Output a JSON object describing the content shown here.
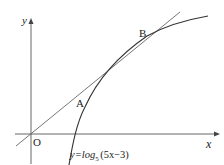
{
  "diagram": {
    "axes": {
      "x_label": "x",
      "y_label": "y",
      "origin_label": "O"
    },
    "points": [
      {
        "label": "A"
      },
      {
        "label": "B"
      }
    ],
    "curve": {
      "label_prefix": "y=log",
      "label_base": "5",
      "label_arg": "(5x−3)"
    },
    "colors": {
      "axis": "#444444",
      "curve": "#333333",
      "line": "#555555",
      "text": "#222222"
    }
  }
}
